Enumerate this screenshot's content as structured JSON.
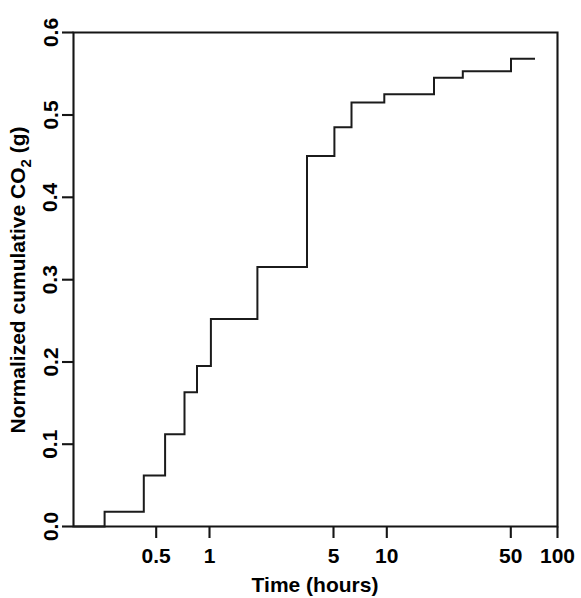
{
  "chart_data": {
    "type": "line",
    "subtype": "step-post",
    "title": "",
    "xlabel": "Time (hours)",
    "ylabel": "Normalized cumulative CO2 (g)",
    "ylabel_parts": {
      "prefix": "Normalized cumulative CO",
      "subscript": "2",
      "suffix": " (g)"
    },
    "xscale": "log",
    "yscale": "linear",
    "xlim": [
      0.2,
      110
    ],
    "ylim": [
      0.0,
      0.6
    ],
    "grid": false,
    "legend": null,
    "x_ticks": [
      0.5,
      1,
      5,
      10,
      50,
      100
    ],
    "x_tick_labels": [
      "0.5",
      "1",
      "5",
      "10",
      "50",
      "100"
    ],
    "y_ticks": [
      0.0,
      0.1,
      0.2,
      0.3,
      0.4,
      0.5,
      0.6
    ],
    "y_tick_labels": [
      "0.0",
      "0.1",
      "0.2",
      "0.3",
      "0.4",
      "0.5",
      "0.6"
    ],
    "series": [
      {
        "name": "Normalized cumulative CO2",
        "x": [
          0.2,
          0.3,
          0.5,
          0.66,
          0.85,
          1.0,
          1.2,
          1.6,
          2.2,
          4.2,
          6.0,
          7.5,
          11.5,
          22.0,
          32.0,
          60.0,
          72.0
        ],
        "y": [
          0.0,
          0.018,
          0.062,
          0.112,
          0.163,
          0.195,
          0.252,
          0.252,
          0.315,
          0.45,
          0.485,
          0.515,
          0.525,
          0.545,
          0.553,
          0.568,
          0.568
        ],
        "points": [
          {
            "x": 0.2,
            "y": 0.0
          },
          {
            "x": 0.3,
            "y": 0.018
          },
          {
            "x": 0.5,
            "y": 0.062
          },
          {
            "x": 0.66,
            "y": 0.112
          },
          {
            "x": 0.85,
            "y": 0.163
          },
          {
            "x": 1.0,
            "y": 0.195
          },
          {
            "x": 1.2,
            "y": 0.252
          },
          {
            "x": 2.2,
            "y": 0.315
          },
          {
            "x": 4.2,
            "y": 0.45
          },
          {
            "x": 6.0,
            "y": 0.485
          },
          {
            "x": 7.5,
            "y": 0.515
          },
          {
            "x": 11.5,
            "y": 0.525
          },
          {
            "x": 22.0,
            "y": 0.545
          },
          {
            "x": 32.0,
            "y": 0.553
          },
          {
            "x": 60.0,
            "y": 0.568
          },
          {
            "x": 72.0,
            "y": 0.568
          }
        ],
        "color": "#1b1b1b"
      }
    ]
  }
}
